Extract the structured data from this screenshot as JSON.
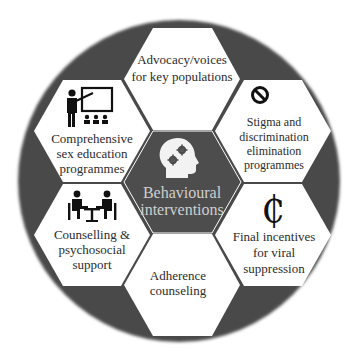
{
  "diagram": {
    "type": "honeycomb",
    "colors": {
      "circle_fill": "#4a4a4a",
      "center_hex_fill": "#4d4d4d",
      "outer_hex_fill": "#ffffff",
      "text": "#2b2b2b",
      "center_text": "#cfcfcf"
    },
    "center": {
      "icon": "head-gears-icon",
      "lines": [
        "Behavioural",
        "interventions"
      ]
    },
    "hexagons": [
      {
        "id": "top",
        "icon": null,
        "lines": [
          "Advocacy/voices",
          "for key populations"
        ]
      },
      {
        "id": "upper-left",
        "icon": "teacher-presentation-icon",
        "lines": [
          "Comprehensive",
          "sex education",
          "programmes"
        ]
      },
      {
        "id": "upper-right",
        "icon": "prohibition-icon",
        "lines": [
          "Stigma and",
          "discrimination",
          "elimination",
          "programmes"
        ]
      },
      {
        "id": "lower-left",
        "icon": "counselling-meeting-icon",
        "lines": [
          "Counselling &",
          "psychosocial",
          "support"
        ]
      },
      {
        "id": "lower-right",
        "icon": "cent-sign-icon",
        "icon_glyph": "₵",
        "lines": [
          "Final incentives",
          "for viral",
          "suppression"
        ]
      },
      {
        "id": "bottom",
        "icon": null,
        "lines": [
          "Adherence",
          "counseling"
        ]
      }
    ]
  }
}
